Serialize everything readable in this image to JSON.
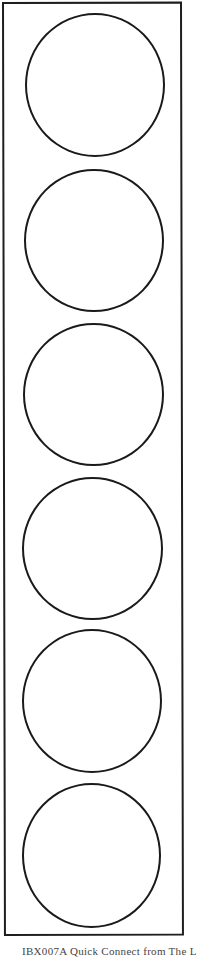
{
  "document": {
    "type": "label-sheet",
    "frame_color": "#1e1e1e",
    "circle_color": "#1a1a1a",
    "background": "#ffffff"
  },
  "labels": [
    {
      "index": 1,
      "shape": "circle",
      "content": ""
    },
    {
      "index": 2,
      "shape": "circle",
      "content": ""
    },
    {
      "index": 3,
      "shape": "circle",
      "content": ""
    },
    {
      "index": 4,
      "shape": "circle",
      "content": ""
    },
    {
      "index": 5,
      "shape": "circle",
      "content": ""
    },
    {
      "index": 6,
      "shape": "circle",
      "content": ""
    }
  ],
  "footer": {
    "text": "IBX007A Quick Connect from The L"
  }
}
